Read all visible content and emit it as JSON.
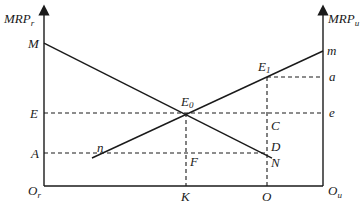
{
  "diagram": {
    "left_axis_label": "MRP",
    "left_axis_sub": "r",
    "right_axis_label": "MRP",
    "right_axis_sub": "u",
    "left_origin": "O",
    "left_origin_sub": "r",
    "right_origin": "O",
    "right_origin_sub": "u",
    "points": {
      "M": "M",
      "m": "m",
      "E": "E",
      "A": "A",
      "n": "n",
      "E0": "E",
      "E0_sub": "0",
      "E1": "E",
      "E1_sub": "1",
      "a": "a",
      "e": "e",
      "C": "C",
      "D": "D",
      "N": "N",
      "F": "F",
      "K": "K",
      "O": "O"
    }
  }
}
